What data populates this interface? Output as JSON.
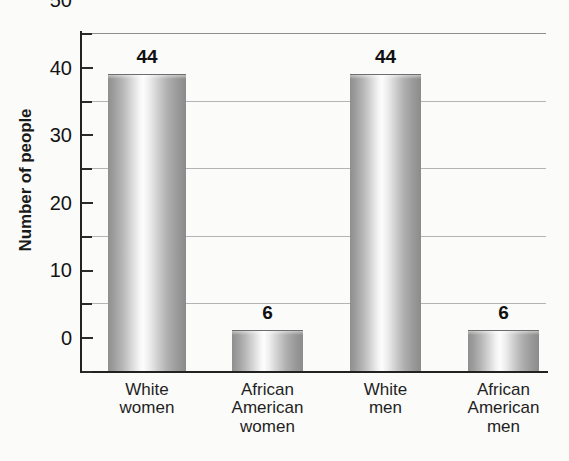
{
  "chart_data": {
    "type": "bar",
    "title": "",
    "subtitle": "",
    "xlabel": "",
    "ylabel": "Number of people",
    "ylim": [
      0,
      50
    ],
    "ytick_step": 10,
    "yminor_step": 5,
    "grid": true,
    "legend": null,
    "categories": [
      "White women",
      "African American women",
      "White men",
      "African American men"
    ],
    "category_lines": [
      [
        "White",
        "women"
      ],
      [
        "African",
        "American",
        "women"
      ],
      [
        "White",
        "men"
      ],
      [
        "African",
        "American",
        "men"
      ]
    ],
    "values": [
      44,
      6,
      44,
      6
    ],
    "value_labels": [
      "44",
      "6",
      "44",
      "6"
    ],
    "ytick_labels": [
      "0",
      "10",
      "20",
      "30",
      "40",
      "50"
    ],
    "ytick_values": [
      0,
      10,
      20,
      30,
      40,
      50
    ],
    "yminor_values": [
      5,
      15,
      25,
      35,
      45
    ],
    "colors": {
      "background": "#fbfbf9",
      "axis": "#222222",
      "gridline": "#b4b4b4",
      "bar_dark": "#8f8f8f",
      "bar_light": "#fdfdfd",
      "text": "#141414"
    }
  }
}
